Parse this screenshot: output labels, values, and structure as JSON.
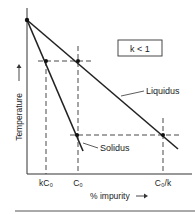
{
  "diagram": {
    "type": "phase-diagram",
    "condition_label": "k < 1",
    "y_axis_label": "Temperature",
    "x_axis_label": "% impurity",
    "curves": [
      {
        "name": "Liquidus",
        "label": "Liquidus"
      },
      {
        "name": "Solidus",
        "label": "Solidus"
      }
    ],
    "x_ticks": [
      {
        "label": "kC₀"
      },
      {
        "label": "C₀"
      },
      {
        "label": "C₀/k"
      }
    ],
    "colors": {
      "line": "#222222",
      "background": "#ffffff"
    }
  }
}
